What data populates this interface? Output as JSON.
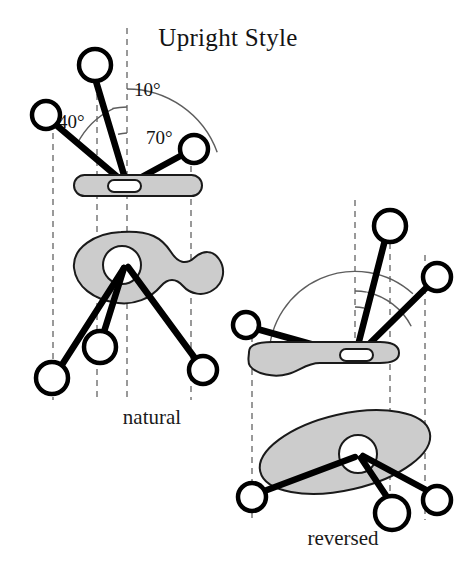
{
  "figure": {
    "title": "Upright Style",
    "background_color": "#ffffff",
    "ink_color": "#000000",
    "shape_fill_color": "#cccccc",
    "guide_line_color": "#808080"
  },
  "panels": [
    {
      "id": "natural",
      "caption": "natural",
      "caption_position": {
        "x": 152,
        "y": 424
      },
      "pivot": {
        "x": 127,
        "y": 185
      },
      "angle_labels": [
        {
          "text": "10°",
          "x": 134,
          "y": 96,
          "degrees": 10
        },
        {
          "text": "40°",
          "x": 62,
          "y": 127,
          "degrees": 40
        },
        {
          "text": "70°",
          "x": 146,
          "y": 143,
          "degrees": 70
        }
      ],
      "angle_arcs": [
        {
          "degrees": 10,
          "radius": 52
        },
        {
          "degrees": 40,
          "radius": 78
        },
        {
          "degrees": 70,
          "radius": 96
        }
      ],
      "top_view": {
        "shape": "rounded-bar",
        "bar": {
          "x": 74,
          "y": 175,
          "width": 128,
          "height": 21,
          "radius": 10
        },
        "hole": {
          "x": 108,
          "y": 180,
          "width": 32,
          "height": 11,
          "radius": 5
        }
      },
      "bottom_view": {
        "shape": "peanut-blob",
        "hole": {
          "cx": 122,
          "cy": 265,
          "r": 19
        }
      },
      "top_balls": [
        {
          "cx": 95,
          "cy": 65,
          "r": 16,
          "label": "ball-10deg"
        },
        {
          "cx": 46,
          "cy": 115,
          "r": 14,
          "label": "ball-40deg"
        },
        {
          "cx": 194,
          "cy": 149,
          "r": 14,
          "label": "ball-70deg"
        }
      ],
      "bottom_balls": [
        {
          "cx": 100,
          "cy": 347,
          "r": 16,
          "label": "ball-lower-center"
        },
        {
          "cx": 52,
          "cy": 378,
          "r": 16,
          "label": "ball-lower-left"
        },
        {
          "cx": 203,
          "cy": 370,
          "r": 14,
          "label": "ball-lower-right"
        }
      ],
      "guide_lines": [
        {
          "x": 53,
          "y1": 122,
          "y2": 400
        },
        {
          "x": 97,
          "y1": 72,
          "y2": 400
        },
        {
          "x": 127,
          "y1": 28,
          "y2": 400
        },
        {
          "x": 191,
          "y1": 155,
          "y2": 400
        }
      ]
    },
    {
      "id": "reversed",
      "caption": "reversed",
      "caption_position": {
        "x": 343,
        "y": 545
      },
      "pivot": {
        "x": 355,
        "y": 357
      },
      "angle_labels": [],
      "angle_arcs": [
        {
          "degrees": 10,
          "radius": 50
        },
        {
          "degrees": 40,
          "radius": 66
        },
        {
          "degrees": 70,
          "radius": 86
        }
      ],
      "top_view": {
        "shape": "blade",
        "hole": {
          "x": 340,
          "y": 350,
          "width": 32,
          "height": 11,
          "radius": 5
        }
      },
      "bottom_view": {
        "shape": "tilted-ellipse",
        "hole": {
          "cx": 358,
          "cy": 455,
          "r": 19
        }
      },
      "top_balls": [
        {
          "cx": 390,
          "cy": 226,
          "r": 16,
          "label": "ball-10deg"
        },
        {
          "cx": 246,
          "cy": 325,
          "r": 13,
          "label": "ball-40deg"
        },
        {
          "cx": 437,
          "cy": 277,
          "r": 14,
          "label": "ball-70deg"
        }
      ],
      "bottom_balls": [
        {
          "cx": 252,
          "cy": 497,
          "r": 14,
          "label": "ball-lower-left"
        },
        {
          "cx": 392,
          "cy": 513,
          "r": 17,
          "label": "ball-lower-center"
        },
        {
          "cx": 437,
          "cy": 500,
          "r": 14,
          "label": "ball-lower-right"
        }
      ],
      "guide_lines": [
        {
          "x": 252,
          "y1": 336,
          "y2": 520
        },
        {
          "x": 355,
          "y1": 200,
          "y2": 358
        },
        {
          "x": 390,
          "y1": 210,
          "y2": 530
        },
        {
          "x": 425,
          "y1": 255,
          "y2": 520
        }
      ]
    }
  ]
}
